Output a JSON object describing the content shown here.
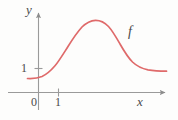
{
  "figure": {
    "background_color": "#fdfdfc",
    "axis_color": "#8c8c8c",
    "label_color": "#4a4a4a",
    "curve_color": "#df6a6a"
  },
  "labels": {
    "y_axis": "y",
    "x_axis": "x",
    "curve": "f",
    "origin": "0",
    "x_tick_one": "1",
    "y_tick_one": "1"
  },
  "chart_data": {
    "type": "line",
    "title": "",
    "xlabel": "x",
    "ylabel": "y",
    "series": [
      {
        "name": "f",
        "annotation": "f",
        "color": "#df6a6a",
        "description": "Smooth curve rising from a low plateau near y=0.6, increasing through y=1 just after x=1, peaking near x=3.2 at about y=3.6, then decreasing to a plateau near y=1.0 at the right edge.",
        "x": [
          -0.4,
          0.0,
          0.4,
          0.8,
          1.2,
          1.6,
          2.0,
          2.4,
          2.8,
          3.2,
          3.6,
          4.0,
          4.4,
          4.8,
          5.2,
          5.6,
          6.0,
          6.4,
          6.8
        ],
        "y": [
          0.6,
          0.62,
          0.7,
          0.92,
          1.3,
          1.8,
          2.35,
          2.9,
          3.35,
          3.58,
          3.6,
          3.35,
          2.9,
          2.4,
          1.95,
          1.6,
          1.35,
          1.18,
          1.08
        ]
      }
    ],
    "xlim": [
      -0.55,
      7.0
    ],
    "ylim": [
      0,
      4.2
    ],
    "x_ticks": [
      0,
      1
    ],
    "x_tick_labels": [
      "0",
      "1"
    ],
    "y_ticks": [
      1
    ],
    "y_tick_labels": [
      "1"
    ],
    "grid": false,
    "legend": "none",
    "axes_style": "arrow-tipped single x and y axes, no box"
  },
  "geometry": {
    "y_axis_x_px": 38,
    "x_axis_y_px": 92,
    "x_tick_one_px": 58,
    "y_tick_one_px": 68,
    "curve_peak_px": [
      95,
      21
    ],
    "curve_path": "M 27.5 78.5 C 33 78.8, 38 78.2, 42 76.5 C 47 74.2, 51 70.5, 55 65.8 C 59.5 60.3, 63.5 53.5, 68 46.5 C 72.5 39.3, 77 32.5, 82 27 C 86.5 22.6, 90.5 20.6, 95.5 20.3 C 100.5 20.2, 104.5 22.3, 108.5 26.5 C 112.5 30.8, 116 37, 120 44 C 124 51, 128 57.5, 132.5 62 C 137 66.3, 142 68.6, 148 69.8 C 154 70.8, 160 71.1, 166.5 71.2"
  }
}
